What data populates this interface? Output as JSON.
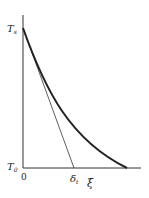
{
  "figure": {
    "y_axis_top_label": "T",
    "y_axis_top_label_sub": "s",
    "y_axis_bottom_label": "T",
    "y_axis_bottom_label_sub": "0",
    "x_origin_label": "0",
    "x_mark_label": "δ",
    "x_mark_label_sub": "t",
    "x_axis_label": "ξ"
  },
  "colors": {
    "curve": "#222222",
    "axis": "#333333",
    "tangent": "#333333"
  }
}
